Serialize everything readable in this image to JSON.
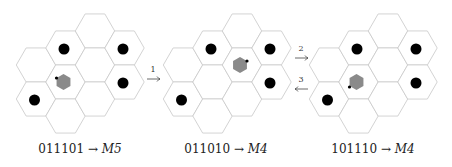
{
  "diagram": {
    "hex_radius": 19.7,
    "col_spacing": 29.5,
    "colors": {
      "cell_stroke": "#c8c8c8",
      "cell_fill": "#ffffff",
      "token": "#000000",
      "agent": "#8a8a8a",
      "agent_marker": "#000000"
    },
    "grid_layout": [
      {
        "col": 0,
        "rows_y": [
          65,
          99
        ]
      },
      {
        "col": 1,
        "rows_y": [
          48,
          82,
          116
        ]
      },
      {
        "col": 2,
        "rows_y": [
          31,
          65,
          99
        ]
      },
      {
        "col": 3,
        "rows_y": [
          48,
          82
        ]
      }
    ],
    "panels": [
      {
        "id": "panel-1",
        "origin_x": 36,
        "code": "011101",
        "arrow": "→",
        "move": "M5",
        "tokens": [
          {
            "col": 1,
            "y": 48
          },
          {
            "col": 3,
            "y": 48
          },
          {
            "col": 3,
            "y": 82
          },
          {
            "col": 0,
            "y": 99
          }
        ],
        "agent": {
          "col": 1,
          "y": 82,
          "marker": "upper-left"
        },
        "caption_x": 80
      },
      {
        "id": "panel-2",
        "origin_x": 183,
        "code": "011010",
        "arrow": "→",
        "move": "M4",
        "tokens": [
          {
            "col": 1,
            "y": 48
          },
          {
            "col": 3,
            "y": 48
          },
          {
            "col": 3,
            "y": 82
          },
          {
            "col": 0,
            "y": 99
          }
        ],
        "agent": {
          "col": 2,
          "y": 65,
          "marker": "upper-right"
        },
        "caption_x": 226
      },
      {
        "id": "panel-3",
        "origin_x": 329,
        "code": "101110",
        "arrow": "→",
        "move": "M4",
        "tokens": [
          {
            "col": 1,
            "y": 48
          },
          {
            "col": 3,
            "y": 48
          },
          {
            "col": 3,
            "y": 82
          },
          {
            "col": 0,
            "y": 99
          }
        ],
        "agent": {
          "col": 1,
          "y": 82,
          "marker": "lower-left"
        },
        "caption_x": 373
      }
    ],
    "transitions": [
      {
        "label": "1",
        "direction": "right",
        "x1": 147,
        "x2": 160,
        "y": 79,
        "label_x": 153,
        "label_y": 66
      },
      {
        "label": "2",
        "direction": "right",
        "x1": 295,
        "x2": 308,
        "y": 58,
        "label_x": 301,
        "label_y": 45
      },
      {
        "label": "3",
        "direction": "left",
        "x1": 308,
        "x2": 295,
        "y": 89,
        "label_x": 301,
        "label_y": 76
      }
    ]
  },
  "captions": [
    {
      "code": "011101",
      "arrow": "→",
      "move": "M5"
    },
    {
      "code": "011010",
      "arrow": "→",
      "move": "M4"
    },
    {
      "code": "101110",
      "arrow": "→",
      "move": "M4"
    }
  ],
  "step_labels": [
    "1",
    "2",
    "3"
  ]
}
